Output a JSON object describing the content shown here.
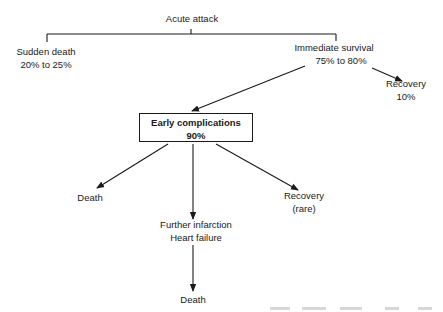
{
  "diagram": {
    "type": "flowchart",
    "topic": "Outcomes of acute attack (myocardial infarction)",
    "nodes": {
      "root": {
        "label": "Acute attack"
      },
      "sudden_death": {
        "line1": "Sudden death",
        "line2": "20% to 25%"
      },
      "immediate_survival": {
        "line1": "Immediate survival",
        "line2": "75% to 80%"
      },
      "recovery_immediate": {
        "line1": "Recovery",
        "line2": "10%"
      },
      "early_complications": {
        "line1": "Early complications",
        "line2": "90%"
      },
      "death_early": {
        "label": "Death"
      },
      "recovery_rare": {
        "line1": "Recovery",
        "line2": "(rare)"
      },
      "further": {
        "line1": "Further infarction",
        "line2": "Heart failure"
      },
      "death_final": {
        "label": "Death"
      }
    },
    "edges": [
      {
        "from": "root",
        "to": "sudden_death",
        "style": "bracket"
      },
      {
        "from": "root",
        "to": "immediate_survival",
        "style": "bracket"
      },
      {
        "from": "immediate_survival",
        "to": "recovery_immediate",
        "style": "arrow"
      },
      {
        "from": "immediate_survival",
        "to": "early_complications",
        "style": "arrow"
      },
      {
        "from": "early_complications",
        "to": "death_early",
        "style": "arrow"
      },
      {
        "from": "early_complications",
        "to": "further",
        "style": "arrow"
      },
      {
        "from": "early_complications",
        "to": "recovery_rare",
        "style": "arrow"
      },
      {
        "from": "further",
        "to": "death_final",
        "style": "arrow"
      }
    ],
    "colors": {
      "ink": "#1a1a1a",
      "background": "#ffffff"
    }
  }
}
